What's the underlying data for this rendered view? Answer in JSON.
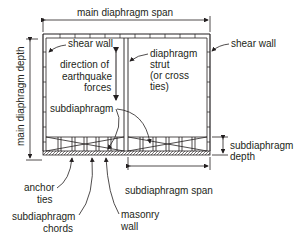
{
  "diagram": {
    "labels": {
      "main_span": "main diaphragm span",
      "main_depth": "main diaphragm depth",
      "shear_wall_left": "shear wall",
      "shear_wall_right": "shear wall",
      "direction_line1": "direction of",
      "direction_line2": "earthquake",
      "direction_line3": "forces",
      "strut_line1": "diaphragm",
      "strut_line2": "strut",
      "strut_line3": "(or cross",
      "strut_line4": "ties)",
      "subdiaphragm": "subdiaphragm",
      "sub_depth_line1": "subdiaphragm",
      "sub_depth_line2": "depth",
      "sub_span": "subdiaphragm span",
      "anchor_line1": "anchor",
      "anchor_line2": "ties",
      "chords_line1": "subdiaphragm",
      "chords_line2": "chords",
      "masonry_line1": "masonry",
      "masonry_line2": "wall"
    },
    "colors": {
      "line": "#231f20",
      "background": "#ffffff"
    }
  }
}
